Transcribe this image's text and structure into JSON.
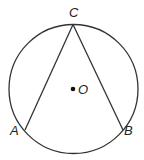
{
  "diagram": {
    "circle": {
      "cx": 73.5,
      "cy": 89,
      "r": 64.5
    },
    "center": {
      "label": "O",
      "x": 73,
      "y": 89
    },
    "points": [
      {
        "label": "C",
        "x": 73,
        "y": 24
      },
      {
        "label": "A",
        "x": 25,
        "y": 130
      },
      {
        "label": "B",
        "x": 123,
        "y": 130
      }
    ],
    "segments": [
      [
        "C",
        "A"
      ],
      [
        "C",
        "B"
      ]
    ],
    "stroke_color": "#333333"
  }
}
